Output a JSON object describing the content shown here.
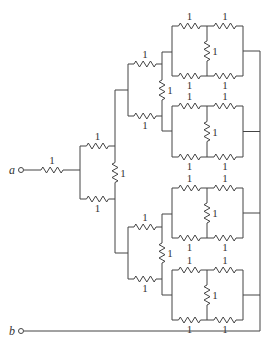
{
  "diagram": {
    "type": "resistor-network",
    "terminals": [
      {
        "id": "a",
        "label": "a"
      },
      {
        "id": "b",
        "label": "b"
      }
    ],
    "resistor_value_label": "1",
    "resistor_count": 31,
    "labels": {
      "a": "a",
      "b": "b",
      "r": "1"
    },
    "wire_color": "#444444",
    "text_color": "#333333"
  }
}
